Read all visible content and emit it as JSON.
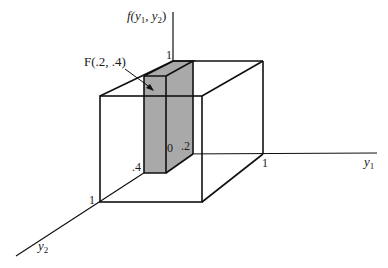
{
  "diagram": {
    "colors": {
      "slab_fill": "#a9a9a9",
      "stroke": "#111111",
      "background": "#ffffff"
    },
    "axes": {
      "vertical_label_f": "f(",
      "vertical_label_y1": "y",
      "vertical_label_sub1": "1",
      "vertical_label_comma": ", ",
      "vertical_label_y2": "y",
      "vertical_label_sub2": "2",
      "vertical_label_close": ")",
      "y1_label": "y",
      "y1_sub": "1",
      "y2_label": "y",
      "y2_sub": "2"
    },
    "ticks": {
      "vertical_one": "1",
      "y1_one": "1",
      "y2_one": "1",
      "origin": "0",
      "y1_point2": ".2",
      "y2_point4": ".4"
    },
    "annotation": {
      "label": "F(.2, .4)"
    }
  }
}
